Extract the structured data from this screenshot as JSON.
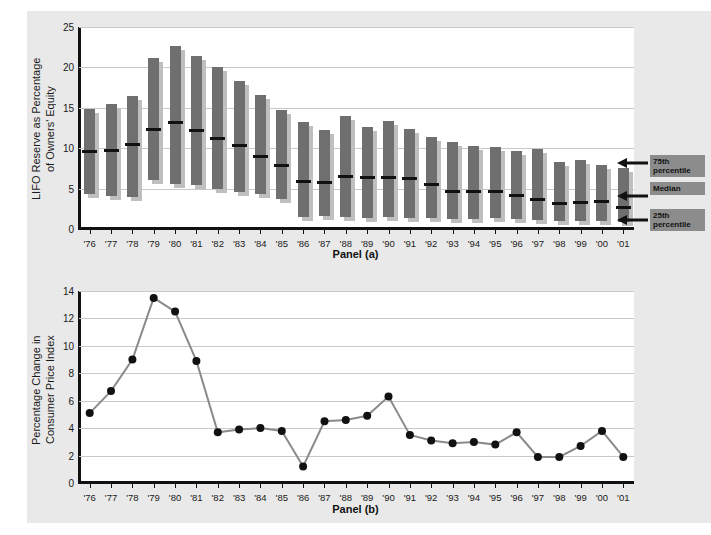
{
  "figure": {
    "background_color": "#e9e9e9",
    "bar_color": "#6f6f6f",
    "bar_shadow_color": "#bfbfbf",
    "line_color": "#8a8a8a",
    "marker_color": "#111111",
    "annotation_box_color": "#8c8c8c"
  },
  "panel_a": {
    "panel_label": "Panel (a)",
    "ylabel": "LIFO Reserve as Percentage\nof Owners' Equity",
    "yticks": [
      0,
      5,
      10,
      15,
      20,
      25
    ],
    "annotations": [
      {
        "label": "75th\npercentile",
        "name": "annotation-75th-percentile"
      },
      {
        "label": "Median",
        "name": "annotation-median"
      },
      {
        "label": "25th\npercentile",
        "name": "annotation-25th-percentile"
      }
    ]
  },
  "panel_b": {
    "panel_label": "Panel (b)",
    "ylabel": "Percentage Change in\nConsumer Price Index",
    "yticks": [
      0,
      2,
      4,
      6,
      8,
      10,
      12,
      14
    ]
  },
  "chart_data": [
    {
      "type": "bar",
      "name": "panel-a-lifo-reserve-box",
      "title": "Panel (a)",
      "xlabel": "",
      "ylabel": "LIFO Reserve as Percentage of Owners' Equity",
      "ylim": [
        0,
        25
      ],
      "grid": true,
      "categories": [
        "'76",
        "'77",
        "'78",
        "'79",
        "'80",
        "'81",
        "'82",
        "'83",
        "'84",
        "'85",
        "'86",
        "'87",
        "'88",
        "'89",
        "'90",
        "'91",
        "'92",
        "'93",
        "'94",
        "'95",
        "'96",
        "'97",
        "'98",
        "'99",
        "'00",
        "'01"
      ],
      "series": [
        {
          "name": "75th percentile",
          "values": [
            14.9,
            15.5,
            16.4,
            21.2,
            22.6,
            21.4,
            20.0,
            18.3,
            16.6,
            14.7,
            13.2,
            12.3,
            14.0,
            12.6,
            13.4,
            12.4,
            11.4,
            10.8,
            10.3,
            10.2,
            9.6,
            9.9,
            8.3,
            8.6,
            7.9,
            7.5
          ]
        },
        {
          "name": "Median",
          "values": [
            9.6,
            9.7,
            10.4,
            12.3,
            13.2,
            12.2,
            11.2,
            10.3,
            9.0,
            7.8,
            5.9,
            5.8,
            6.5,
            6.4,
            6.4,
            6.2,
            5.5,
            4.7,
            4.7,
            4.7,
            4.2,
            3.6,
            3.2,
            3.3,
            3.4,
            2.6
          ]
        },
        {
          "name": "25th percentile",
          "values": [
            4.3,
            4.1,
            4.0,
            6.1,
            5.6,
            5.4,
            5.0,
            4.6,
            4.3,
            3.7,
            1.5,
            1.6,
            1.5,
            1.4,
            1.5,
            1.3,
            1.3,
            1.2,
            1.2,
            1.3,
            1.2,
            1.1,
            1.0,
            1.0,
            1.0,
            0.9
          ]
        }
      ]
    },
    {
      "type": "line",
      "name": "panel-b-cpi-change",
      "title": "Panel (b)",
      "xlabel": "",
      "ylabel": "Percentage Change in Consumer Price Index",
      "ylim": [
        0,
        14
      ],
      "grid": true,
      "categories": [
        "'76",
        "'77",
        "'78",
        "'79",
        "'80",
        "'81",
        "'82",
        "'83",
        "'84",
        "'85",
        "'86",
        "'87",
        "'88",
        "'89",
        "'90",
        "'91",
        "'92",
        "'93",
        "'94",
        "'95",
        "'96",
        "'97",
        "'98",
        "'99",
        "'00",
        "'01"
      ],
      "values": [
        5.1,
        6.7,
        9.0,
        13.5,
        12.5,
        8.9,
        3.7,
        3.9,
        4.0,
        3.8,
        1.2,
        4.5,
        4.6,
        4.9,
        6.3,
        3.5,
        3.1,
        2.9,
        3.0,
        2.8,
        3.7,
        1.9,
        1.9,
        2.7,
        3.8,
        1.9
      ]
    }
  ]
}
